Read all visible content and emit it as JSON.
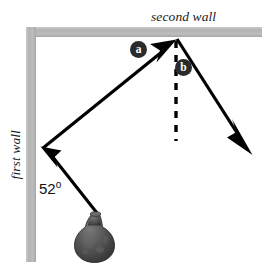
{
  "figure": {
    "title": "",
    "labels": {
      "second_wall": "second wall",
      "first_wall": "first wall",
      "angle": "52",
      "degree_symbol": "o",
      "marker_a": "a",
      "marker_b": "b"
    },
    "colors": {
      "wall": "#b6b6b6",
      "wall_shade": "#a9a9a9",
      "line": "#000000",
      "marker_fill": "#2b2b2b",
      "marker_text": "#ffffff",
      "background": "#ffffff",
      "vase_dark": "#3b3b3b",
      "vase_mid": "#5a5a5a",
      "vase_light": "#7b7b7b"
    },
    "objects": {
      "vase": "vase",
      "dashed_normal": "dashed-normal-line"
    },
    "geometry": {
      "walls": {
        "vertical": {
          "x": 26,
          "y": 27,
          "width": 10,
          "height": 235
        },
        "horizontal": {
          "x": 26,
          "y": 27,
          "width": 236,
          "height": 10
        }
      },
      "path_points": [
        {
          "name": "source",
          "x": 99,
          "y": 215
        },
        {
          "name": "first-wall-bounce",
          "x": 42,
          "y": 147
        },
        {
          "name": "second-wall-bounce",
          "x": 176,
          "y": 39
        },
        {
          "name": "exit",
          "x": 252,
          "y": 152
        }
      ],
      "dashed_line": {
        "x": 176,
        "y1": 40,
        "y2": 141
      },
      "incidence_angle_deg": 52
    }
  }
}
